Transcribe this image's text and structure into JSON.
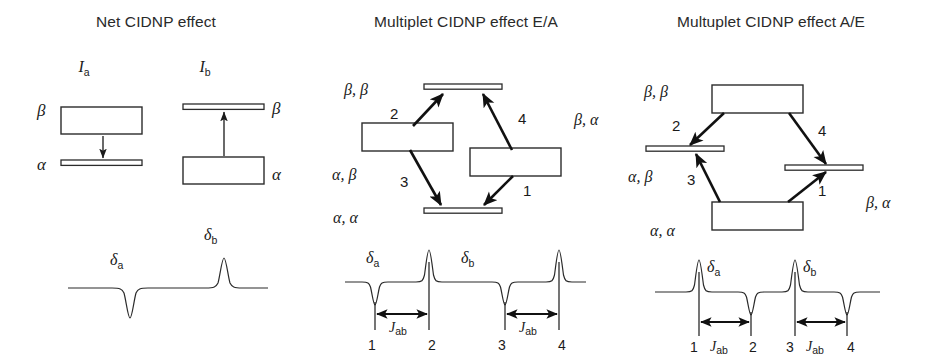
{
  "figure": {
    "background_color": "#ffffff",
    "ink_color": "#1a1a1a",
    "width": 925,
    "height": 358
  },
  "panels": [
    {
      "id": "net",
      "title": "Net CIDNP effect",
      "nucleus_labels": [
        {
          "base": "I",
          "sub": "a"
        },
        {
          "base": "I",
          "sub": "b"
        }
      ],
      "level_labels": {
        "upper": "β",
        "lower": "α"
      },
      "transitions": [
        {
          "nucleus": "I_a",
          "direction": "down",
          "meaning": "emission"
        },
        {
          "nucleus": "I_b",
          "direction": "up",
          "meaning": "absorption"
        }
      ],
      "populations": [
        {
          "nucleus": "I_a",
          "level": "β",
          "state": "overpopulated"
        },
        {
          "nucleus": "I_a",
          "level": "α",
          "state": "normal"
        },
        {
          "nucleus": "I_b",
          "level": "β",
          "state": "normal"
        },
        {
          "nucleus": "I_b",
          "level": "α",
          "state": "overpopulated"
        }
      ],
      "spectrum": {
        "peaks": [
          {
            "label_base": "δ",
            "label_sub": "a",
            "sign": "negative"
          },
          {
            "label_base": "δ",
            "label_sub": "b",
            "sign": "positive"
          }
        ]
      }
    },
    {
      "id": "ea",
      "title": "Multiplet CIDNP effect E/A",
      "level_labels": {
        "top": "β, β",
        "left": "α, β",
        "right": "β, α",
        "bottom": "α, α"
      },
      "populations": [
        {
          "level": "β, β",
          "state": "normal"
        },
        {
          "level": "α, β",
          "state": "overpopulated"
        },
        {
          "level": "β, α",
          "state": "overpopulated"
        },
        {
          "level": "α, α",
          "state": "normal"
        }
      ],
      "transitions": [
        {
          "number": "1",
          "from": "β, α",
          "to": "α, α",
          "direction": "down"
        },
        {
          "number": "2",
          "from": "α, β",
          "to": "β, β",
          "direction": "up"
        },
        {
          "number": "3",
          "from": "α, β",
          "to": "α, α",
          "direction": "down"
        },
        {
          "number": "4",
          "from": "β, α",
          "to": "β, β",
          "direction": "up"
        }
      ],
      "spectrum": {
        "pattern": "E/A",
        "multiplets": [
          {
            "shift_base": "δ",
            "shift_sub": "a",
            "coupling_base": "J",
            "coupling_sub": "ab",
            "lines": [
              {
                "number": "1",
                "sign": "negative"
              },
              {
                "number": "2",
                "sign": "positive"
              }
            ]
          },
          {
            "shift_base": "δ",
            "shift_sub": "b",
            "coupling_base": "J",
            "coupling_sub": "ab",
            "lines": [
              {
                "number": "3",
                "sign": "negative"
              },
              {
                "number": "4",
                "sign": "positive"
              }
            ]
          }
        ]
      }
    },
    {
      "id": "ae",
      "title": "Multuplet CIDNP effect A/E",
      "level_labels": {
        "top": "β, β",
        "left": "α, β",
        "right": "β, α",
        "bottom": "α, α"
      },
      "populations": [
        {
          "level": "β, β",
          "state": "overpopulated"
        },
        {
          "level": "α, β",
          "state": "normal"
        },
        {
          "level": "β, α",
          "state": "normal"
        },
        {
          "level": "α, α",
          "state": "overpopulated"
        }
      ],
      "transitions": [
        {
          "number": "1",
          "from": "α, α",
          "to": "β, α",
          "direction": "up"
        },
        {
          "number": "2",
          "from": "β, β",
          "to": "α, β",
          "direction": "down"
        },
        {
          "number": "3",
          "from": "α, α",
          "to": "α, β",
          "direction": "up"
        },
        {
          "number": "4",
          "from": "β, β",
          "to": "β, α",
          "direction": "down"
        }
      ],
      "spectrum": {
        "pattern": "A/E",
        "multiplets": [
          {
            "shift_base": "δ",
            "shift_sub": "a",
            "coupling_base": "J",
            "coupling_sub": "ab",
            "lines": [
              {
                "number": "1",
                "sign": "positive"
              },
              {
                "number": "2",
                "sign": "negative"
              }
            ]
          },
          {
            "shift_base": "δ",
            "shift_sub": "b",
            "coupling_base": "J",
            "coupling_sub": "ab",
            "lines": [
              {
                "number": "3",
                "sign": "positive"
              },
              {
                "number": "4",
                "sign": "negative"
              }
            ]
          }
        ]
      }
    }
  ]
}
